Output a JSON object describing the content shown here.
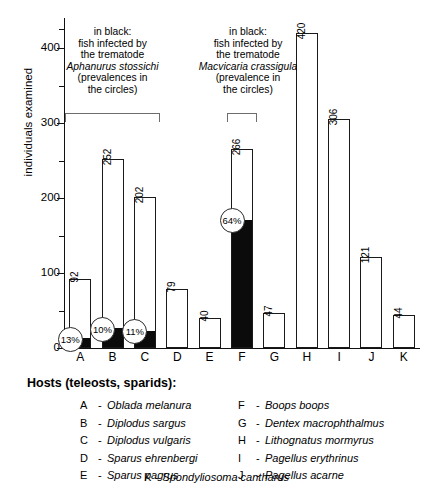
{
  "chart_data": {
    "type": "bar",
    "title": "",
    "xlabel": "",
    "ylabel": "individuals examined",
    "ylim": [
      0,
      440
    ],
    "grid": false,
    "categories": [
      "A",
      "B",
      "C",
      "D",
      "E",
      "F",
      "G",
      "H",
      "I",
      "J",
      "K"
    ],
    "values": [
      92,
      252,
      202,
      79,
      40,
      266,
      47,
      420,
      306,
      121,
      44
    ],
    "value_labels": [
      "92",
      "252",
      "202",
      "79",
      "40",
      "266",
      "47",
      "420",
      "306",
      "121",
      "44"
    ],
    "ytick_labels": [
      "0",
      "100",
      "200",
      "300",
      "400"
    ],
    "ytick_values": [
      0,
      100,
      200,
      300,
      400
    ],
    "yminor_ticks": [
      50,
      150,
      250,
      350
    ],
    "series": [
      {
        "name": "individuals examined",
        "values": [
          92,
          252,
          202,
          79,
          40,
          266,
          47,
          420,
          306,
          121,
          44
        ]
      },
      {
        "name": "fish infected (black portion)",
        "values": [
          12,
          25,
          22,
          0,
          0,
          170,
          0,
          0,
          0,
          0,
          0
        ]
      }
    ],
    "prevalence_labels": {
      "A": "13%",
      "B": "10%",
      "C": "11%",
      "F": "64%"
    },
    "annotations": [
      {
        "id": "note-aphanurus",
        "bracket_categories": [
          "A",
          "B",
          "C"
        ],
        "line1": "in black:",
        "line2": "fish infected by",
        "line3": "the trematode",
        "line4": "Aphanurus stossichi",
        "line5": "(prevalences in",
        "line6": "the circles)"
      },
      {
        "id": "note-macvicaria",
        "bracket_categories": [
          "F"
        ],
        "line1": "in black:",
        "line2": "fish infected by",
        "line3": "the trematode",
        "line4": "Macvicaria crassigula",
        "line5": "(prevalence in",
        "line6": "the circles)"
      }
    ],
    "colors": {
      "bar_fill": "#ffffff",
      "bar_outline": "#1a1a1a",
      "infected_fill": "#0b0b0b",
      "axis": "#111111",
      "bracket": "#6d6d6d",
      "background": "#ffffff"
    }
  },
  "hosts": {
    "title": "Hosts (teleosts, sparids):",
    "dash": "-",
    "left": [
      {
        "key": "A",
        "name": "Oblada melanura"
      },
      {
        "key": "B",
        "name": "Diplodus sargus"
      },
      {
        "key": "C",
        "name": "Diplodus vulgaris"
      },
      {
        "key": "D",
        "name": "Sparus ehrenbergi"
      },
      {
        "key": "E",
        "name": "Sparus pagrus"
      }
    ],
    "right": [
      {
        "key": "F",
        "name": "Boops boops"
      },
      {
        "key": "G",
        "name": "Dentex macrophthalmus"
      },
      {
        "key": "H",
        "name": "Lithognatus mormyrus"
      },
      {
        "key": "I",
        "name": "Pagellus erythrinus"
      },
      {
        "key": "J",
        "name": "Pagellus acarne"
      }
    ],
    "last": {
      "key": "K",
      "name": "Spondyliosoma cantharus"
    }
  }
}
